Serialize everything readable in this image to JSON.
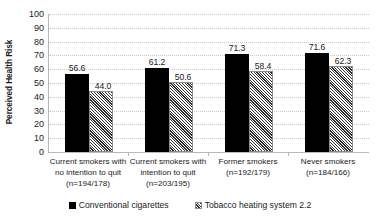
{
  "chart_data": {
    "type": "bar",
    "title": "",
    "subtitle": "",
    "xlabel": "",
    "ylabel": "Perceived Health Risk",
    "ylim": [
      0,
      100
    ],
    "ytick_step": 10,
    "yticks": [
      "100",
      "90",
      "80",
      "70",
      "60",
      "50",
      "40",
      "30",
      "20",
      "10",
      "0"
    ],
    "grid": "horizontal-dotted",
    "legend_position": "bottom-center",
    "categories": [
      "Current smokers with no intention to quit (n=194/178)",
      "Current smokers with intention to quit (n=203/195)",
      "Former smokers (n=192/179)",
      "Never smokers (n=184/166)"
    ],
    "series": [
      {
        "name": "Conventional cigarettes",
        "color": "#000000",
        "fill": "solid-black",
        "values": [
          56.6,
          44.0,
          71.3,
          71.6
        ]
      },
      {
        "name": "Tobacco heating system 2.2",
        "color": "#808080",
        "fill": "diagonal-hatch",
        "values": [
          0,
          0,
          0,
          0
        ]
      }
    ],
    "groups": [
      {
        "category": "Current smokers with no intention to quit (n=194/178)",
        "bars": [
          {
            "series": "Conventional cigarettes",
            "value": 56.6,
            "label": "56.6"
          },
          {
            "series": "Tobacco heating system 2.2",
            "value": 44.0,
            "label": "44.0"
          }
        ]
      },
      {
        "category": "Current smokers with intention to quit (n=203/195)",
        "bars": [
          {
            "series": "Conventional cigarettes",
            "value": 61.2,
            "label": "61.2"
          },
          {
            "series": "Tobacco heating system 2.2",
            "value": 50.6,
            "label": "50.6"
          }
        ]
      },
      {
        "category": "Former smokers (n=192/179)",
        "bars": [
          {
            "series": "Conventional cigarettes",
            "value": 71.3,
            "label": "71.3"
          },
          {
            "series": "Tobacco heating system 2.2",
            "value": 58.4,
            "label": "58.4"
          }
        ]
      },
      {
        "category": "Never smokers (n=184/166)",
        "bars": [
          {
            "series": "Conventional cigarettes",
            "value": 71.6,
            "label": "71.6"
          },
          {
            "series": "Tobacco heating system 2.2",
            "value": 62.3,
            "label": "62.3"
          }
        ]
      }
    ]
  },
  "axis": {
    "y_title": "Perceived Health Risk",
    "y_tick_labels": [
      "100",
      "90",
      "80",
      "70",
      "60",
      "50",
      "40",
      "30",
      "20",
      "10",
      "0"
    ]
  },
  "x_labels": [
    "Current smokers with no intention to quit (n=194/178)",
    "Current smokers with intention to quit (n=203/195)",
    "Former smokers (n=192/179)",
    "Never smokers (n=184/166)"
  ],
  "legend": {
    "items": [
      {
        "label": "Conventional cigarettes"
      },
      {
        "label": "Tobacco heating system 2.2"
      }
    ]
  }
}
